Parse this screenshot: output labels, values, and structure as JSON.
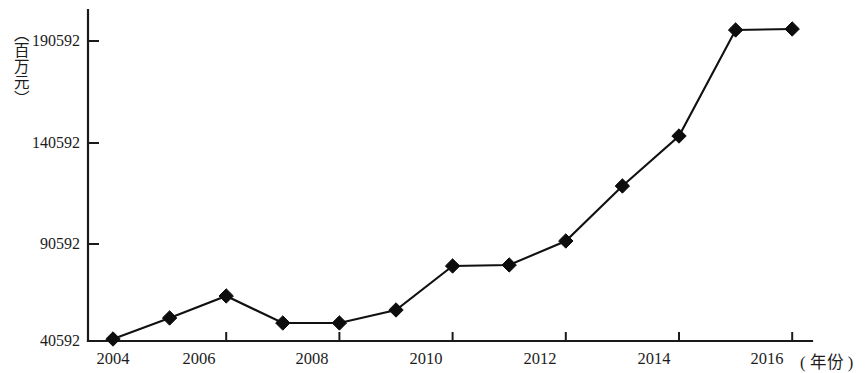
{
  "chart_data": {
    "type": "line",
    "title": "",
    "xlabel": "( 年份 )",
    "ylabel": "（百万元）",
    "x": [
      2004,
      2005,
      2006,
      2007,
      2008,
      2009,
      2010,
      2011,
      2012,
      2013,
      2014,
      2015,
      2016
    ],
    "categories": [
      "2004",
      "2005",
      "2006",
      "2007",
      "2008",
      "2009",
      "2010",
      "2011",
      "2012",
      "2013",
      "2014",
      "2015",
      "2016"
    ],
    "values": [
      41600,
      52100,
      63100,
      49600,
      49600,
      56100,
      78100,
      78600,
      90600,
      118100,
      143100,
      196100,
      196600
    ],
    "series": [
      {
        "name": "",
        "values": [
          41600,
          52100,
          63100,
          49600,
          49600,
          56100,
          78100,
          78600,
          90600,
          118100,
          143100,
          196100,
          196600
        ]
      }
    ],
    "xlim": [
      2004,
      2017.3
    ],
    "ylim": [
      40592,
      196900
    ],
    "xticks": [
      2004,
      2006,
      2008,
      2010,
      2012,
      2014,
      2016
    ],
    "xticklabels": [
      "2004",
      "2006",
      "2008",
      "2010",
      "2012",
      "2014",
      "2016"
    ],
    "yticks": [
      40592,
      90592,
      140592,
      190592
    ],
    "yticklabels": [
      "40592",
      "90592",
      "140592",
      "190592"
    ],
    "grid": false,
    "legend": false,
    "legend_position": "none",
    "marker": "diamond",
    "line_color": "#111111",
    "marker_color": "#0d0d0d",
    "background_color": "#ffffff"
  },
  "axis": {
    "y_title": "（百万元）",
    "x_title": "( 年份 )",
    "y_tick_labels": [
      "190592",
      "140592",
      "90592",
      "40592"
    ],
    "x_tick_labels": [
      "2004",
      "2006",
      "2008",
      "2010",
      "2012",
      "2014",
      "2016"
    ]
  }
}
